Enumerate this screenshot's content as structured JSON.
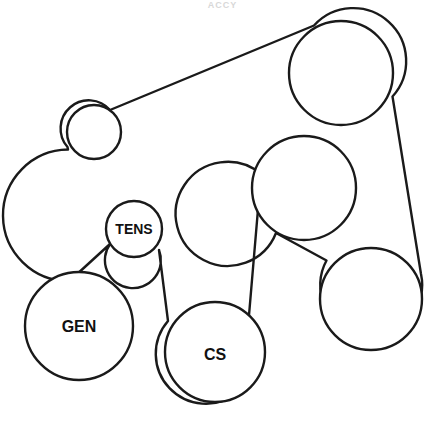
{
  "diagram": {
    "caption_top": "ACCY",
    "width": 445,
    "height": 433,
    "background_color": "#ffffff",
    "line_color": "#1a1a1a",
    "line_width": 2.4,
    "label_color": "#111111",
    "label_font_size": 15
  },
  "pulleys": [
    {
      "id": "idler-upper-left",
      "label": "",
      "name": "idler pulley",
      "cx": 94,
      "cy": 132,
      "r": 27
    },
    {
      "id": "tensioner",
      "label": "TENS",
      "name": "belt tensioner",
      "cx": 134,
      "cy": 229,
      "r": 28,
      "label_x": 134,
      "label_y": 229,
      "label_font_size": 14
    },
    {
      "id": "generator",
      "label": "GEN",
      "name": "generator / alternator",
      "cx": 79,
      "cy": 326,
      "r": 54,
      "label_x": 79,
      "label_y": 326,
      "label_font_size": 16
    },
    {
      "id": "crankshaft",
      "label": "CS",
      "name": "crankshaft",
      "cx": 215,
      "cy": 352,
      "r": 50,
      "label_x": 215,
      "label_y": 354,
      "label_font_size": 16
    },
    {
      "id": "upper-right",
      "label": "",
      "name": "upper right accessory pulley",
      "cx": 341,
      "cy": 73,
      "r": 52
    },
    {
      "id": "middle-right",
      "label": "",
      "name": "middle right accessory pulley",
      "cx": 304,
      "cy": 188,
      "r": 52
    },
    {
      "id": "lower-right",
      "label": "",
      "name": "lower right accessory pulley",
      "cx": 371,
      "cy": 299,
      "r": 51
    }
  ],
  "belt": {
    "description": "Single serpentine belt routed around all seven pulleys",
    "path": "M 110.0 110.0 L 314.0 25.5 A 52 52 0 0 1 392.5 96.5 L 421.0 274.0 A 51 51 0 1 1 326.5 260.5 L 276.0 233.0 A 52 52 0 1 1 261.0 174.0 L 248.0 327.0 A 50 50 0 1 1 168.0 321.0 L 159.0 250.0 A 28 28 0 1 1 110.0 244.0 L 69.5 281.0 A 54 54 0 1 1 68.0 149.5 L 67.5 147.0 A 27 27 0 0 1 110.0 110.0 Z",
    "segments": [
      "idler top → upper-right pulley top-left",
      "upper-right pulley right → lower-right pulley right",
      "lower-right pulley top-left → middle-right pulley bottom-right",
      "middle-right pulley bottom-left → crankshaft right",
      "crankshaft left → tensioner right",
      "tensioner left → generator right",
      "generator left → idler left"
    ]
  }
}
